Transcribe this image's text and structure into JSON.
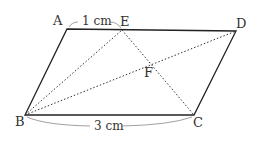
{
  "diagram": {
    "type": "parallelogram",
    "points": {
      "A": {
        "label": "A",
        "x": 67,
        "y": 29
      },
      "E": {
        "label": "E",
        "x": 122,
        "y": 30
      },
      "D": {
        "label": "D",
        "x": 236,
        "y": 31
      },
      "B": {
        "label": "B",
        "x": 25,
        "y": 115
      },
      "C": {
        "label": "C",
        "x": 194,
        "y": 115
      },
      "F": {
        "label": "F",
        "x": 152,
        "y": 64
      }
    },
    "measures": {
      "AE": "1 cm",
      "BC": "3 cm"
    },
    "colors": {
      "solid": "#222222",
      "dotted": "#333333",
      "arc": "#888888"
    }
  }
}
